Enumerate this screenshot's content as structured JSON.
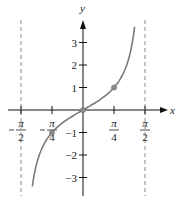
{
  "chart_data": {
    "type": "line",
    "title": "",
    "function": "y = tan(x)",
    "xlabel": "x",
    "ylabel": "y",
    "xlim": [
      -1.6,
      1.7
    ],
    "ylim": [
      -3.6,
      3.9
    ],
    "x_ticks": [
      {
        "value": -1.5708,
        "label_num": "π",
        "label_den": "2",
        "negative": true
      },
      {
        "value": -0.7854,
        "label_num": "π",
        "label_den": "4",
        "negative": true
      },
      {
        "value": 0.7854,
        "label_num": "π",
        "label_den": "4",
        "negative": false
      },
      {
        "value": 1.5708,
        "label_num": "π",
        "label_den": "2",
        "negative": false
      }
    ],
    "y_ticks": [
      {
        "value": 3,
        "label": "3"
      },
      {
        "value": 2,
        "label": "2"
      },
      {
        "value": 1,
        "label": "1"
      },
      {
        "value": -1,
        "label": "−1"
      },
      {
        "value": -2,
        "label": "−2"
      },
      {
        "value": -3,
        "label": "−3"
      }
    ],
    "asymptotes": [
      -1.5708,
      1.5708
    ],
    "marked_points": [
      {
        "x": -0.7854,
        "y": -1
      },
      {
        "x": 0,
        "y": 0
      },
      {
        "x": 0.7854,
        "y": 1
      }
    ],
    "series": [
      {
        "name": "tan x",
        "color": "#7a7a7a",
        "x": [
          -1.29,
          -1.2,
          -1.1,
          -1.0,
          -0.9,
          -0.7854,
          -0.6,
          -0.4,
          -0.2,
          0,
          0.2,
          0.4,
          0.6,
          0.7854,
          0.9,
          1.0,
          1.1,
          1.2,
          1.31
        ],
        "values": [
          -3.4,
          -2.57,
          -1.96,
          -1.56,
          -1.26,
          -1.0,
          -0.68,
          -0.42,
          -0.2,
          0,
          0.2,
          0.42,
          0.68,
          1.0,
          1.26,
          1.56,
          1.96,
          2.57,
          3.7
        ]
      }
    ],
    "grid": false,
    "legend": null
  },
  "colors": {
    "curve": "#7a7a7a",
    "axis": "#111111",
    "asymptote": "#8a8a8a",
    "point": "#8a8a8a"
  }
}
